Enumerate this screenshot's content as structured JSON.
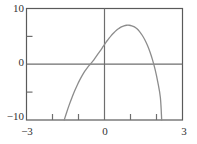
{
  "chart_data": {
    "type": "line",
    "title": "",
    "xlabel": "",
    "ylabel": "",
    "xlim": [
      -3,
      3
    ],
    "ylim": [
      -10,
      10
    ],
    "grid": false,
    "legend": null,
    "axis_lines": {
      "x_axis_at_y": 0,
      "y_axis_at_x": 0
    },
    "x_ticks": [
      -3,
      0,
      3
    ],
    "x_tick_labels": [
      "−3",
      "0",
      "3"
    ],
    "x_minor_ticks": [
      -2,
      -1,
      1,
      2
    ],
    "y_ticks": [
      -10,
      0,
      10
    ],
    "y_tick_labels": [
      "−10",
      "0",
      "10"
    ],
    "y_minor_ticks": [
      -5,
      5
    ],
    "series": [
      {
        "name": "curve",
        "color": "#8c8c8c",
        "x": [
          -1.55,
          -1.45,
          -1.35,
          -1.25,
          -1.15,
          -1.05,
          -0.95,
          -0.85,
          -0.75,
          -0.65,
          -0.55,
          -0.45,
          -0.35,
          -0.25,
          -0.15,
          -0.05,
          0.05,
          0.15,
          0.25,
          0.35,
          0.45,
          0.55,
          0.65,
          0.75,
          0.85,
          0.95,
          1.05,
          1.15,
          1.25,
          1.35,
          1.45,
          1.55,
          1.65,
          1.75,
          1.85,
          1.95,
          2.05,
          2.15,
          2.2
        ],
        "y": [
          -10.0,
          -8.55,
          -7.2,
          -5.95,
          -4.8,
          -3.75,
          -2.8,
          -1.95,
          -1.2,
          -0.55,
          0.0,
          0.55,
          1.2,
          1.85,
          2.5,
          3.2,
          3.9,
          4.5,
          5.1,
          5.6,
          6.05,
          6.4,
          6.7,
          6.9,
          7.0,
          7.0,
          6.9,
          6.7,
          6.35,
          5.85,
          5.2,
          4.4,
          3.4,
          2.2,
          0.75,
          -1.0,
          -3.2,
          -6.0,
          -10.0
        ]
      }
    ]
  },
  "labels": {
    "y_top": "10",
    "y_zero": "0",
    "y_bottom": "−10",
    "x_left": "−3",
    "x_zero": "0",
    "x_right": "3"
  },
  "colors": {
    "frame": "#5a5a5a",
    "axis": "#6e6e6e",
    "curve": "#8c8c8c",
    "text": "#333333",
    "background": "#ffffff"
  }
}
